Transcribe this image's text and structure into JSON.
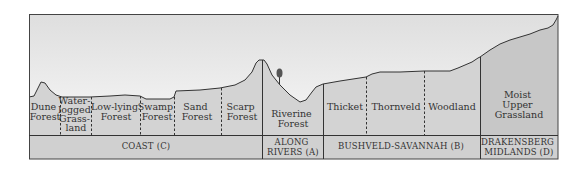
{
  "diagram": {
    "type": "vegetation-profile-cross-section",
    "colors": {
      "sky_top": "#dedede",
      "sky_bottom": "#f6f6f6",
      "ground": "#d3d3d3",
      "ground_drakensberg": "#c6c6c6",
      "band": "#d0d0d0",
      "line": "#333333"
    },
    "zones": [
      {
        "id": "coast",
        "label": "COAST (C)",
        "vegetation": [
          {
            "lines": [
              "Dune",
              "Forest"
            ]
          },
          {
            "lines": [
              "Water-",
              "logged",
              "Grass-",
              "land"
            ]
          },
          {
            "lines": [
              "Low-lying",
              "Forest"
            ]
          },
          {
            "lines": [
              "Swamp",
              "Forest"
            ]
          },
          {
            "lines": [
              "Sand",
              "Forest"
            ]
          },
          {
            "lines": [
              "Scarp",
              "Forest"
            ]
          }
        ]
      },
      {
        "id": "rivers",
        "label_lines": [
          "ALONG",
          "RIVERS (A)"
        ],
        "vegetation": [
          {
            "lines": [
              "Riverine",
              "Forest"
            ]
          }
        ]
      },
      {
        "id": "bushveld",
        "label": "BUSHVELD-SAVANNAH (B)",
        "vegetation": [
          {
            "lines": [
              "Thicket"
            ]
          },
          {
            "lines": [
              "Thornveld"
            ]
          },
          {
            "lines": [
              "Woodland"
            ]
          }
        ]
      },
      {
        "id": "drakensberg",
        "label_lines": [
          "DRAKENSBERG",
          "MIDLANDS (D)"
        ],
        "vegetation": [
          {
            "lines": [
              "Moist",
              "Upper",
              "Grassland"
            ]
          }
        ]
      }
    ],
    "icons": {
      "tree": "tree-icon"
    }
  }
}
